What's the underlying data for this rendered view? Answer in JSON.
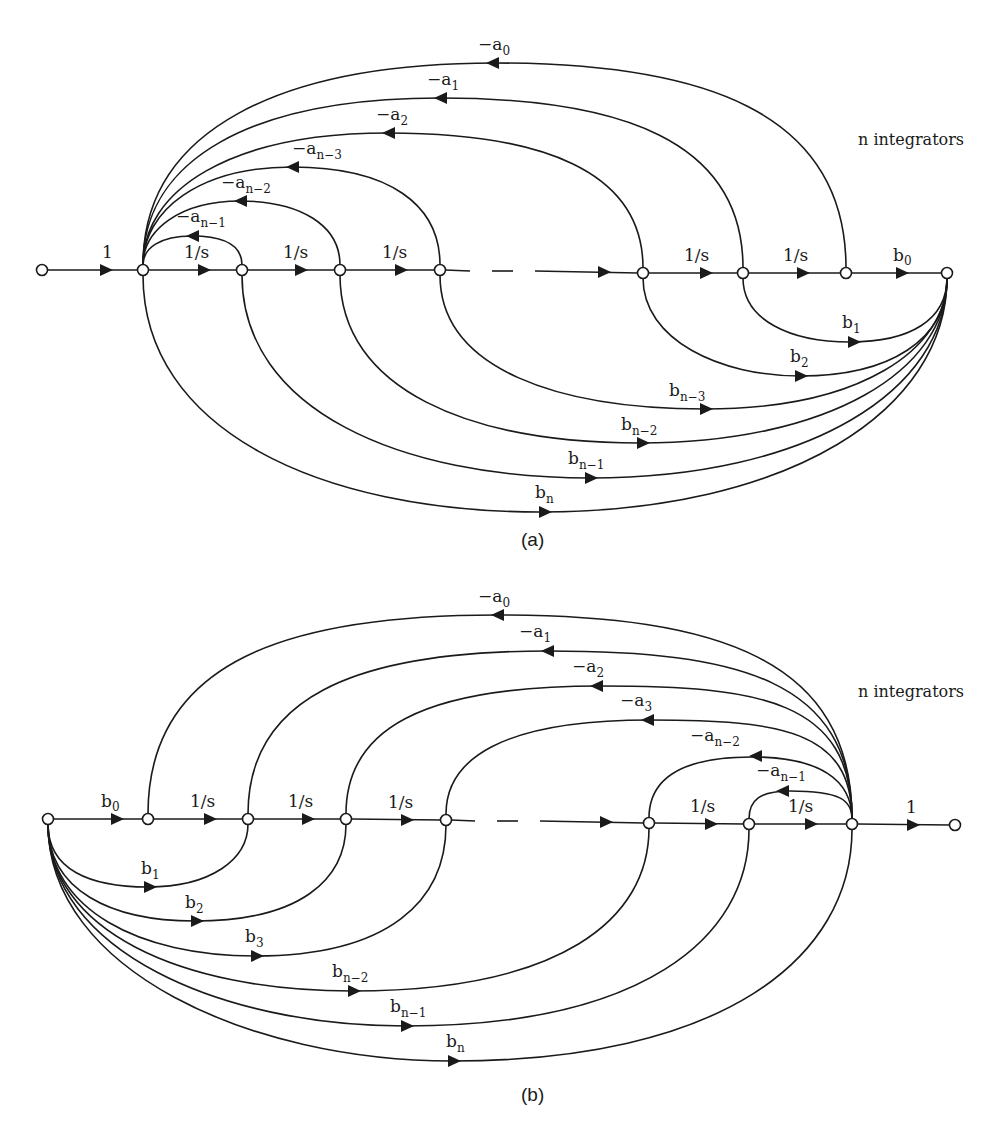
{
  "figure": {
    "a": {
      "caption": "(a)",
      "note": "n integrators",
      "forward_gains": {
        "input": "1",
        "integrator1": "1/s",
        "integrator2": "1/s",
        "integrator3": "1/s",
        "integrator_n_minus_1": "1/s",
        "integrator_n": "1/s",
        "output": "b",
        "output_sub": "0"
      },
      "feedback": [
        {
          "base": "−a",
          "sub": "0"
        },
        {
          "base": "−a",
          "sub": "1"
        },
        {
          "base": "−a",
          "sub": "2"
        },
        {
          "base": "−a",
          "sub": "n−3"
        },
        {
          "base": "−a",
          "sub": "n−2"
        },
        {
          "base": "−a",
          "sub": "n−1"
        }
      ],
      "feedforward": [
        {
          "base": "b",
          "sub": "1"
        },
        {
          "base": "b",
          "sub": "2"
        },
        {
          "base": "b",
          "sub": "n−3"
        },
        {
          "base": "b",
          "sub": "n−2"
        },
        {
          "base": "b",
          "sub": "n−1"
        },
        {
          "base": "b",
          "sub": "n"
        }
      ]
    },
    "b": {
      "caption": "(b)",
      "note": "n integrators",
      "forward_gains": {
        "input": "b",
        "input_sub": "0",
        "integrator1": "1/s",
        "integrator2": "1/s",
        "integrator3": "1/s",
        "integrator_n_minus_1": "1/s",
        "integrator_n": "1/s",
        "output": "1"
      },
      "feedback": [
        {
          "base": "−a",
          "sub": "0"
        },
        {
          "base": "−a",
          "sub": "1"
        },
        {
          "base": "−a",
          "sub": "2"
        },
        {
          "base": "−a",
          "sub": "3"
        },
        {
          "base": "−a",
          "sub": "n−2"
        },
        {
          "base": "−a",
          "sub": "n−1"
        }
      ],
      "feedforward": [
        {
          "base": "b",
          "sub": "1"
        },
        {
          "base": "b",
          "sub": "2"
        },
        {
          "base": "b",
          "sub": "3"
        },
        {
          "base": "b",
          "sub": "n−2"
        },
        {
          "base": "b",
          "sub": "n−1"
        },
        {
          "base": "b",
          "sub": "n"
        }
      ]
    }
  }
}
